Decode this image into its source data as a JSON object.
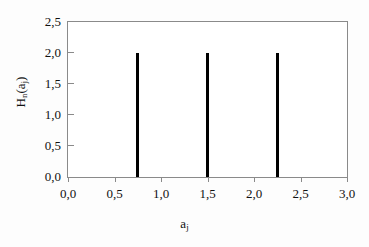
{
  "chart_data": {
    "type": "bar",
    "title": "",
    "subtitle": "",
    "xlabel": "a_j",
    "ylabel": "H_n(a_j)",
    "xlabel_parts": {
      "base": "a",
      "sub": "j"
    },
    "ylabel_parts": {
      "base1": "H",
      "sub1": "n",
      "mid": "(a",
      "sub2": "j",
      "end": ")"
    },
    "x": [
      0.75,
      1.5,
      2.25
    ],
    "values": [
      2.0,
      2.0,
      2.0
    ],
    "categories": [
      "0,75",
      "1,50",
      "2,25"
    ],
    "xlim": [
      0.0,
      3.0
    ],
    "ylim": [
      0.0,
      2.5
    ],
    "xticks": [
      0.0,
      0.5,
      1.0,
      1.5,
      2.0,
      2.5,
      3.0
    ],
    "yticks": [
      0.0,
      0.5,
      1.0,
      1.5,
      2.0,
      2.5
    ],
    "xticklabels": [
      "0,0",
      "0,5",
      "1,0",
      "1,5",
      "2,0",
      "2,5",
      "3,0"
    ],
    "yticklabels": [
      "0,0",
      "0,5",
      "1,0",
      "1,5",
      "2,0",
      "2,5"
    ],
    "grid": false,
    "legend": null,
    "bar_color": "#000000",
    "axis_color": "#8a8a8a",
    "background_color": "#ffffff",
    "decimal_separator": ","
  }
}
